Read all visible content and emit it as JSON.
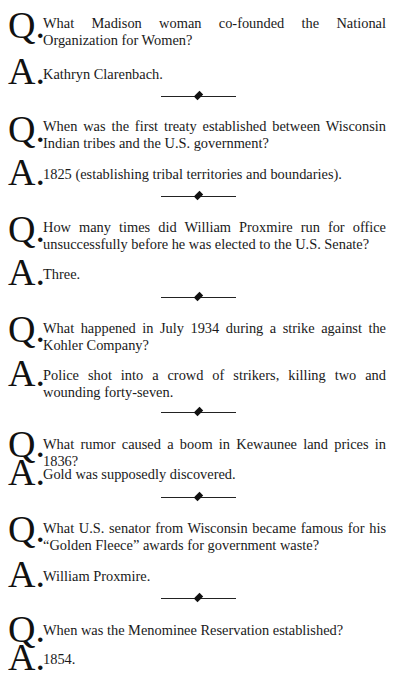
{
  "q_label": "Q.",
  "a_label": "A.",
  "items": [
    {
      "question": "What Madison woman co-founded the National Organization for Women?",
      "answer": "Kathryn Clarenbach."
    },
    {
      "question": "When was the first treaty established between Wisconsin Indian tribes and the U.S. government?",
      "answer": "1825 (establishing tribal territories and boundaries)."
    },
    {
      "question": "How many times did William Proxmire run for office unsuccessfully before he was elected to the U.S. Senate?",
      "answer": "Three."
    },
    {
      "question": "What happened in July 1934 during a strike against the Kohler Company?",
      "answer": "Police shot into a crowd of strikers, killing two and wounding forty-seven."
    },
    {
      "question": "What rumor caused a boom in Kewaunee land prices in 1836?",
      "answer": "Gold was supposedly discovered."
    },
    {
      "question": "What U.S. senator from Wisconsin became famous for his “Golden Fleece” awards for government waste?",
      "answer": "William Proxmire."
    },
    {
      "question": "When was the Menominee Reservation established?",
      "answer": "1854."
    }
  ]
}
